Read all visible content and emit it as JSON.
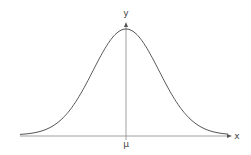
{
  "diagram": {
    "x_axis_label": "x",
    "y_axis_label": "y",
    "mean_label": "μ",
    "curve_color": "#555555",
    "axis_color": "#777777"
  },
  "chart_data": {
    "type": "line",
    "title": "",
    "xlabel": "x",
    "ylabel": "y",
    "tick_labels": [
      "μ"
    ],
    "grid": false
  }
}
